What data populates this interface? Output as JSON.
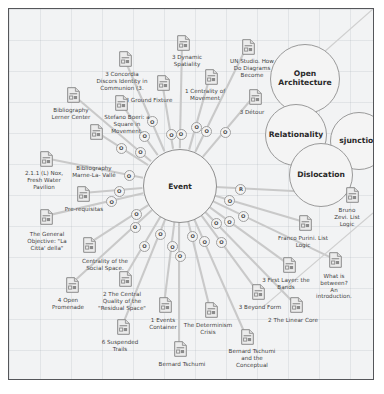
{
  "diagram": {
    "title_node": "Event",
    "center_label": "Event",
    "clusters": [
      {
        "id": "open-architecture",
        "label": "Open\nArchitecture",
        "x": 296,
        "y": 70,
        "r": 35
      },
      {
        "id": "relationality",
        "label": "Relationality",
        "x": 287,
        "y": 126,
        "r": 31
      },
      {
        "id": "disjunction",
        "label": "sjunction",
        "x": 350,
        "y": 132,
        "r": 29
      },
      {
        "id": "dislocation",
        "label": "Dislocation",
        "x": 312,
        "y": 166,
        "r": 32
      }
    ],
    "node_marks": {
      "o_label": "O",
      "r_label": "R"
    },
    "documents": [
      {
        "id": "doc-dynamic-spatiality",
        "label": "3 Dynamic\nSpatiality",
        "icon_x": 168,
        "icon_y": 26,
        "label_x": 178,
        "label_y": 45
      },
      {
        "id": "doc-un-studio",
        "label": "UN Studio. How\nDo Diagrams\nBecome",
        "icon_x": 233,
        "icon_y": 30,
        "label_x": 243,
        "label_y": 49
      },
      {
        "id": "doc-concordia-discors",
        "label": "3 Concordia\nDiscors Identity in\nCommunion (3.",
        "icon_x": 110,
        "icon_y": 42,
        "label_x": 113,
        "label_y": 62
      },
      {
        "id": "doc-ground-fixture",
        "label": "3 Ground Fixture",
        "icon_x": 148,
        "icon_y": 66,
        "label_x": 140,
        "label_y": 88
      },
      {
        "id": "doc-centrality-movement",
        "label": "1 Centrality of\nMovement",
        "icon_x": 196,
        "icon_y": 60,
        "label_x": 196,
        "label_y": 79
      },
      {
        "id": "doc-detour",
        "label": "3 Détour",
        "icon_x": 240,
        "icon_y": 80,
        "label_x": 243,
        "label_y": 100
      },
      {
        "id": "doc-bibliography-lerner",
        "label": "Bibliography\nLerner Center",
        "icon_x": 58,
        "icon_y": 78,
        "label_x": 62,
        "label_y": 98
      },
      {
        "id": "doc-stefano-boeri",
        "label": "Stefano Boeri: a\nSquare in\nMovement.",
        "icon_x": 106,
        "icon_y": 86,
        "label_x": 118,
        "label_y": 105
      },
      {
        "id": "doc-bibliography-marne",
        "label": "Bibliography\nMarne-La- Vallé",
        "icon_x": 81,
        "icon_y": 115,
        "label_x": 85,
        "label_y": 156
      },
      {
        "id": "doc-nox-fresh-water",
        "label": "2.1.1 (L) Nox,\nFresh Water\nPavilion",
        "icon_x": 31,
        "icon_y": 142,
        "label_x": 35,
        "label_y": 161
      },
      {
        "id": "doc-pre-requisitas",
        "label": "Pre-requisitas",
        "icon_x": 68,
        "icon_y": 177,
        "label_x": 75,
        "label_y": 197
      },
      {
        "id": "doc-general-objective",
        "label": "The General\nObjective: \"La\nCitta' della\"",
        "icon_x": 31,
        "icon_y": 200,
        "label_x": 38,
        "label_y": 222
      },
      {
        "id": "doc-centrality-social-space",
        "label": "Centrality of the\nSocial Space.",
        "icon_x": 74,
        "icon_y": 228,
        "label_x": 96,
        "label_y": 249
      },
      {
        "id": "doc-open-promenade",
        "label": "4 Open\nPromenade",
        "icon_x": 57,
        "icon_y": 268,
        "label_x": 59,
        "label_y": 288
      },
      {
        "id": "doc-central-quality-residual",
        "label": "2 The Central\nQuality of the\n\"Residual Space\"",
        "icon_x": 110,
        "icon_y": 262,
        "label_x": 113,
        "label_y": 282
      },
      {
        "id": "doc-suspended-trails",
        "label": "6 Suspended\nTrails",
        "icon_x": 108,
        "icon_y": 310,
        "label_x": 111,
        "label_y": 330
      },
      {
        "id": "doc-events-container",
        "label": "1 Events\nContainer",
        "icon_x": 150,
        "icon_y": 288,
        "label_x": 154,
        "label_y": 308
      },
      {
        "id": "doc-bernard-tschumi",
        "label": "Bernard Tschumi",
        "icon_x": 165,
        "icon_y": 332,
        "label_x": 173,
        "label_y": 352
      },
      {
        "id": "doc-determinism-crisis",
        "label": "The Determinism\nCrisis",
        "icon_x": 196,
        "icon_y": 293,
        "label_x": 199,
        "label_y": 313
      },
      {
        "id": "doc-tschumi-conceptual",
        "label": "Bernard Tschumi\nand the\nConceptual",
        "icon_x": 232,
        "icon_y": 320,
        "label_x": 243,
        "label_y": 339
      },
      {
        "id": "doc-beyond-form",
        "label": "3 Beyond Form",
        "icon_x": 243,
        "icon_y": 275,
        "label_x": 251,
        "label_y": 295
      },
      {
        "id": "doc-linear-core",
        "label": "2 The Linear Core",
        "icon_x": 281,
        "icon_y": 288,
        "label_x": 284,
        "label_y": 308
      },
      {
        "id": "doc-first-layer-bands",
        "label": "3 First Layer: the\nBands",
        "icon_x": 274,
        "icon_y": 248,
        "label_x": 277,
        "label_y": 268
      },
      {
        "id": "doc-what-is-between",
        "label": "What is between?\nAn introduction.",
        "icon_x": 320,
        "icon_y": 243,
        "label_x": 325,
        "label_y": 264
      },
      {
        "id": "doc-franco-purini",
        "label": "Franco Purini. List\nLogic",
        "icon_x": 290,
        "icon_y": 206,
        "label_x": 294,
        "label_y": 226
      },
      {
        "id": "doc-bruno-zevi",
        "label": "Bruno Zevi. List\nLogic",
        "icon_x": 337,
        "icon_y": 178,
        "label_x": 338,
        "label_y": 198
      }
    ]
  }
}
